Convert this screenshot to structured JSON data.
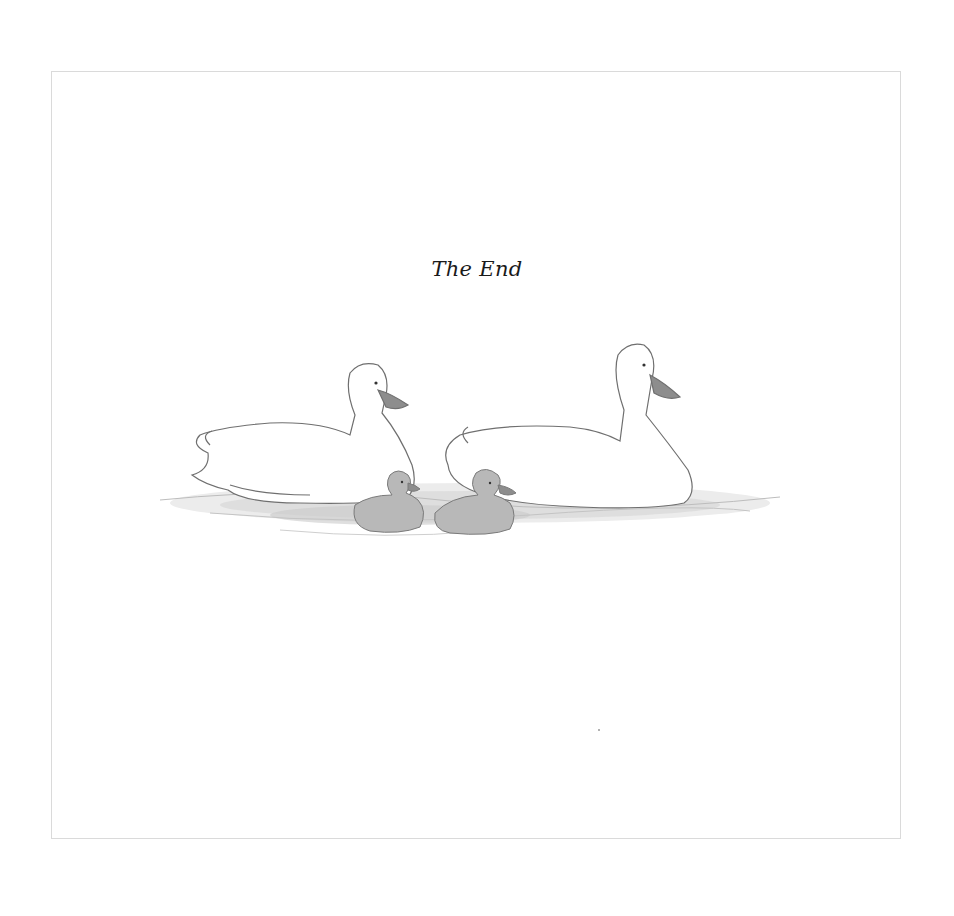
{
  "page": {
    "title": "The End",
    "illustration": {
      "subject": "two white ducks and two gray ducklings swimming on water",
      "figures": [
        {
          "name": "left-duck",
          "color": "#ffffff"
        },
        {
          "name": "right-duck",
          "color": "#ffffff"
        },
        {
          "name": "left-duckling",
          "color": "#b8b8b8"
        },
        {
          "name": "right-duckling",
          "color": "#b8b8b8"
        }
      ]
    }
  },
  "colors": {
    "background": "#ffffff",
    "border": "#dadada",
    "text": "#1a1a1a",
    "sketch_line": "#6f6f6f",
    "beak": "#8d8d8d",
    "duckling": "#b8b8b8",
    "water": "#cfcfcf"
  }
}
